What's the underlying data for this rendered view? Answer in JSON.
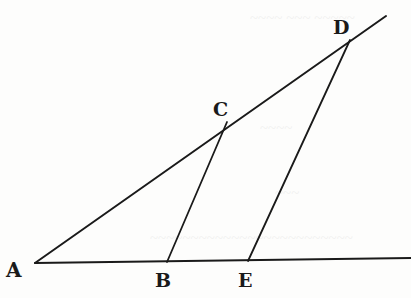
{
  "figure": {
    "colors": {
      "ink": "#1a1a1a",
      "paper": "#fdfdfc"
    },
    "points": {
      "A": {
        "label": "A",
        "x": 35,
        "y": 263
      },
      "B": {
        "label": "B",
        "x": 167,
        "y": 262
      },
      "C": {
        "label": "C",
        "x": 227,
        "y": 122
      },
      "D": {
        "label": "D",
        "x": 350,
        "y": 40
      },
      "E": {
        "label": "E",
        "x": 248,
        "y": 261
      }
    },
    "labels": {
      "A": "A",
      "B": "B",
      "C": "C",
      "D": "D",
      "E": "E"
    },
    "segments": [
      {
        "name": "A-D-extended",
        "from": "A",
        "to": "D",
        "extends_beyond": true
      },
      {
        "name": "A-baseline-extended",
        "from": "A",
        "to": "E",
        "extends_beyond": true
      },
      {
        "name": "C-B",
        "from": "C",
        "to": "B"
      },
      {
        "name": "D-E",
        "from": "D",
        "to": "E"
      }
    ]
  }
}
